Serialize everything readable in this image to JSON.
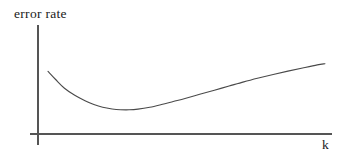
{
  "figure": {
    "kind": "line-plot-schematic",
    "background_color": "#ffffff",
    "width": 345,
    "height": 157
  },
  "axes": {
    "y_axis_label": "error rate",
    "x_axis_label": "k",
    "axis_color": "#555555",
    "axis_stroke_width": 1.1,
    "origin": {
      "x": 38,
      "y": 134
    },
    "y_axis": {
      "x": 38,
      "y_top": 25,
      "y_bottom": 145
    },
    "x_axis": {
      "y": 134,
      "x_left": 30,
      "x_right": 332
    },
    "ticks_visible": false,
    "tick_labels": [],
    "gridlines": false
  },
  "curve": {
    "color": "#4a4a4a",
    "stroke_width": 1.1,
    "shape": "u-shaped",
    "description": "error rate decreases steeply then rises gradually with k",
    "start_point": {
      "x": 48,
      "y": 71
    },
    "minimum_point": {
      "x": 112,
      "y": 113
    },
    "end_point": {
      "x": 325,
      "y": 57
    }
  },
  "chart_data": {
    "type": "line",
    "title": "",
    "subtitle": "",
    "xlabel": "k",
    "ylabel": "error rate",
    "legend": [],
    "legend_position": "none",
    "grid": false,
    "axis_ticks": false,
    "xlim": [
      0,
      100
    ],
    "ylim": [
      0,
      100
    ],
    "annotations": [],
    "series": [
      {
        "name": "error rate",
        "color": "#4a4a4a",
        "x": [
          3.4,
          6.0,
          9.0,
          12.5,
          16.0,
          19.0,
          22.0,
          25.2,
          28.0,
          31.0,
          34.0,
          38.0,
          42.0,
          46.0,
          50.0,
          55.0,
          60.0,
          65.0,
          70.0,
          75.0,
          80.0,
          85.0,
          90.0,
          95.0,
          97.6
        ],
        "y": [
          57.5,
          50.0,
          42.0,
          35.5,
          30.5,
          27.0,
          24.5,
          23.0,
          22.3,
          22.2,
          22.8,
          24.5,
          27.0,
          29.8,
          32.6,
          36.4,
          40.2,
          44.0,
          47.8,
          51.3,
          54.6,
          57.7,
          60.6,
          63.4,
          64.5
        ]
      }
    ]
  }
}
